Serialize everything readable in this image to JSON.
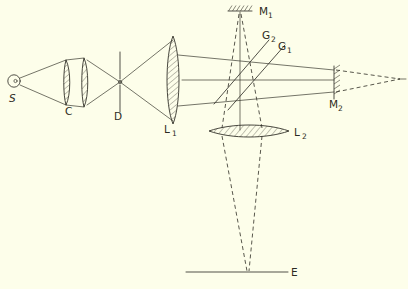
{
  "figure": {
    "domain": "diagram",
    "kind": "optical-ray-diagram",
    "background_color": "#fdfeea",
    "ink_color": "#33322a",
    "width": 408,
    "height": 289
  },
  "labels": {
    "source": "S",
    "condenser": "C",
    "diaphragm": "D",
    "lens1_main": "L",
    "lens1_sub": "1",
    "lens2_main": "L",
    "lens2_sub": "2",
    "mirror1_main": "M",
    "mirror1_sub": "1",
    "mirror2_main": "M",
    "mirror2_sub": "2",
    "grating1_main": "G",
    "grating1_sub": "1",
    "grating2_main": "G",
    "grating2_sub": "2",
    "screen": "E"
  },
  "components": [
    {
      "id": "source",
      "name": "light-source",
      "label": "S",
      "shape": "small-circle",
      "x": 14,
      "y": 81,
      "radius": 6,
      "label_x": 11,
      "label_y": 101
    },
    {
      "id": "condenser",
      "name": "condenser-lens-doublet",
      "label": "C",
      "shape": "two-thin-hatched-lenses",
      "x": 72,
      "y": 82,
      "label_x": 68,
      "label_y": 113
    },
    {
      "id": "diaphragm",
      "name": "aperture-diaphragm",
      "label": "D",
      "shape": "vertical-line-with-pinhole",
      "x": 120,
      "y": 82,
      "label_x": 116,
      "label_y": 118
    },
    {
      "id": "lens1",
      "name": "collimating-lens-L1",
      "label": "L1",
      "shape": "tall-biconvex-hatched-lens",
      "x": 173,
      "y": 80,
      "label_x": 166,
      "label_y": 131
    },
    {
      "id": "grating1",
      "name": "beam-splitter-G1",
      "label": "G1",
      "shape": "diagonal-plate-45deg",
      "label_x": 277,
      "label_y": 48
    },
    {
      "id": "grating2",
      "name": "beam-splitter-G2",
      "label": "G2",
      "shape": "diagonal-plate-45deg",
      "label_x": 262,
      "label_y": 37
    },
    {
      "id": "mirror1",
      "name": "mirror-M1-top",
      "label": "M1",
      "shape": "horizontal-hatched-mirror",
      "x": 239,
      "y": 11,
      "label_x": 258,
      "label_y": 14
    },
    {
      "id": "mirror2",
      "name": "mirror-M2-right",
      "label": "M2",
      "shape": "vertical-hatched-mirror",
      "x": 334,
      "y": 80,
      "label_x": 330,
      "label_y": 106
    },
    {
      "id": "lens2",
      "name": "projection-lens-L2",
      "label": "L2",
      "shape": "wide-flat-biconvex-hatched-lens",
      "x": 248,
      "y": 131,
      "label_x": 296,
      "label_y": 135
    },
    {
      "id": "screen",
      "name": "observation-screen-E",
      "label": "E",
      "shape": "horizontal-line",
      "x": 248,
      "y": 272,
      "label_x": 292,
      "label_y": 275
    }
  ],
  "rays": {
    "solid_note": "source cone to condenser, condenser to diaphragm focus, diaphragm to L1, collimated beam L1 to M2",
    "dashed_note": "virtual rays right of M2 converging to point; M1 cone down through L2 to screen E"
  }
}
